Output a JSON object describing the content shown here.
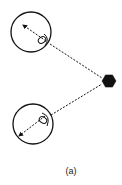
{
  "figure": {
    "caption": "(a)",
    "colors": {
      "stroke": "#111111",
      "fill": "#111111",
      "background": "#ffffff"
    },
    "source": {
      "shape": "hexagon",
      "cx": 109,
      "cy": 81,
      "r": 7
    },
    "receivers": [
      {
        "id": "top",
        "circle": {
          "cx": 31,
          "cy": 32,
          "r": 20
        },
        "arrow": {
          "x1": 46,
          "y1": 41,
          "x2": 23,
          "y2": 25
        },
        "lens": {
          "cx": 42,
          "cy": 40,
          "rx": 4,
          "ry": 3
        },
        "dashed_link": {
          "x1": 50,
          "y1": 44,
          "x2": 102,
          "y2": 78
        }
      },
      {
        "id": "bottom",
        "circle": {
          "cx": 33,
          "cy": 124,
          "r": 20
        },
        "arrow": {
          "x1": 45,
          "y1": 116,
          "x2": 19,
          "y2": 136
        },
        "lens": {
          "cx": 43,
          "cy": 120,
          "rx": 4,
          "ry": 3
        },
        "dashed_link": {
          "x1": 51,
          "y1": 115,
          "x2": 102,
          "y2": 84
        }
      }
    ]
  }
}
